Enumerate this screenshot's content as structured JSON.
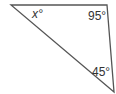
{
  "diagram": {
    "type": "triangle",
    "stroke_color": "#555555",
    "vertices": {
      "top_left": {
        "x": 11,
        "y": 5
      },
      "top_right": {
        "x": 107,
        "y": 5
      },
      "bottom_right": {
        "x": 114,
        "y": 92
      }
    },
    "angles": [
      {
        "vertex": "top_left",
        "label": "x°",
        "variable": "x"
      },
      {
        "vertex": "top_right",
        "label": "95°",
        "value": 95
      },
      {
        "vertex": "bottom_right",
        "label": "45°",
        "value": 45
      }
    ]
  }
}
